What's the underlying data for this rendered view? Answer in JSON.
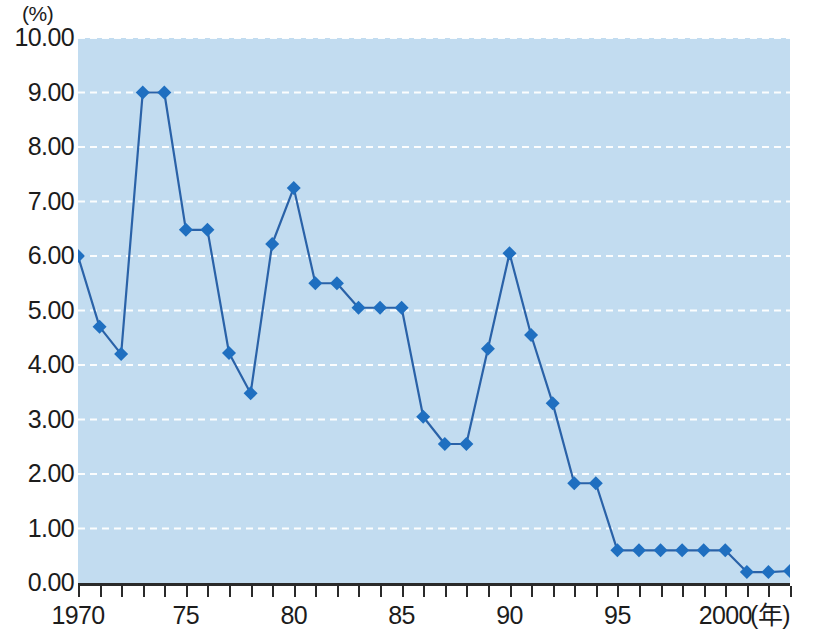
{
  "chart_data": {
    "type": "line",
    "title": "",
    "subtitle": "",
    "xlabel": "(年)",
    "ylabel": "(%)",
    "unit_label": "(%)",
    "xlim": [
      1970,
      2003
    ],
    "ylim": [
      0.0,
      10.0
    ],
    "grid": true,
    "grid_style": "dashed-white-horizontal",
    "legend": "none",
    "marker": "diamond",
    "accent_color": "#1f6fc0",
    "plot_background": "#c2dcf0",
    "gridline_color": "#ffffff",
    "y_tick_labels": [
      "10.00",
      "9.00",
      "8.00",
      "7.00",
      "6.00",
      "5.00",
      "4.00",
      "3.00",
      "2.00",
      "1.00",
      "0.00"
    ],
    "y_tick_values": [
      10,
      9,
      8,
      7,
      6,
      5,
      4,
      3,
      2,
      1,
      0
    ],
    "x_tick_labels": [
      "1970",
      "75",
      "80",
      "85",
      "90",
      "95",
      "2000"
    ],
    "x_tick_values": [
      1970,
      1975,
      1980,
      1985,
      1990,
      1995,
      2000
    ],
    "x_axis_suffix": "(年)",
    "x": [
      1970,
      1971,
      1972,
      1973,
      1974,
      1975,
      1976,
      1977,
      1978,
      1979,
      1980,
      1981,
      1982,
      1983,
      1984,
      1985,
      1986,
      1987,
      1988,
      1989,
      1990,
      1991,
      1992,
      1993,
      1994,
      1995,
      1996,
      1997,
      1998,
      1999,
      2000,
      2001,
      2002,
      2003
    ],
    "values": [
      6.0,
      4.7,
      4.2,
      9.0,
      9.0,
      6.48,
      6.48,
      4.22,
      3.48,
      6.22,
      7.25,
      5.5,
      5.5,
      5.05,
      5.05,
      5.05,
      3.05,
      2.55,
      2.55,
      4.3,
      6.05,
      4.55,
      3.3,
      1.83,
      1.83,
      0.6,
      0.6,
      0.6,
      0.6,
      0.6,
      0.6,
      0.2,
      0.2,
      0.22
    ]
  }
}
